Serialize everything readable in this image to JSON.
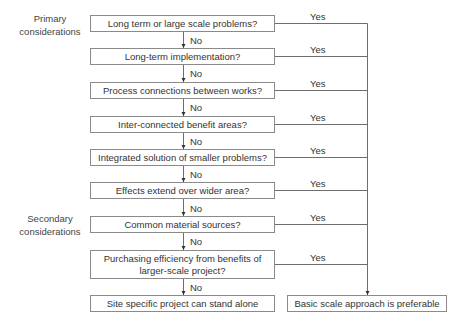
{
  "side_labels": {
    "primary": "Primary considerations",
    "secondary": "Secondary considerations"
  },
  "questions": [
    {
      "text": "Long term or large scale problems?"
    },
    {
      "text": "Long-term implementation?"
    },
    {
      "text": "Process connections between works?"
    },
    {
      "text": "Inter-connected benefit areas?"
    },
    {
      "text": "Integrated solution of smaller problems?"
    },
    {
      "text": "Effects extend over wider area?"
    },
    {
      "text": "Common material sources?"
    },
    {
      "text": "Purchasing efficiency from benefits of larger-scale project?"
    }
  ],
  "edge_labels": {
    "no": "No",
    "yes": "Yes"
  },
  "outcomes": {
    "no_path": "Site specific project can stand alone",
    "yes_path": "Basic scale approach is preferable"
  },
  "colors": {
    "line": "#6e6e6e",
    "box_border": "#8a8a8a",
    "text": "#333333"
  }
}
